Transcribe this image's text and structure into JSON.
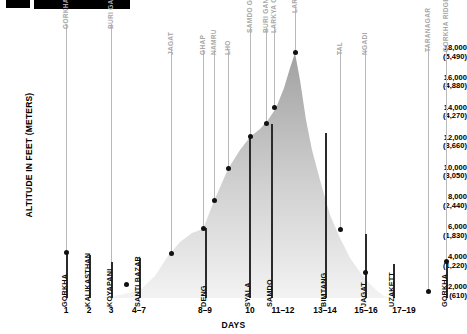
{
  "chart_data": {
    "type": "area",
    "title": "",
    "xlabel": "DAYS",
    "ylabel": "ALTITUDE IN FEET (METERS)",
    "ylim": [
      2000,
      19000
    ],
    "grid": false,
    "legend_position": "none",
    "y_ticks": [
      {
        "feet": "18,000",
        "meters": "(5,490)",
        "value": 18000
      },
      {
        "feet": "16,000",
        "meters": "(4,880)",
        "value": 16000
      },
      {
        "feet": "14,000",
        "meters": "(4,270)",
        "value": 14000
      },
      {
        "feet": "12,000",
        "meters": "(3,660)",
        "value": 12000
      },
      {
        "feet": "10,000",
        "meters": "(3,050)",
        "value": 10000
      },
      {
        "feet": "8,000",
        "meters": "(2,440)",
        "value": 8000
      },
      {
        "feet": "6,000",
        "meters": "(1,830)",
        "value": 6000
      },
      {
        "feet": "4,000",
        "meters": "(1,220)",
        "value": 4000
      },
      {
        "feet": "2,000",
        "meters": "(610)",
        "value": 2000
      }
    ],
    "day_labels": [
      {
        "label": "1",
        "x": 66
      },
      {
        "label": "2",
        "x": 89
      },
      {
        "label": "3",
        "x": 111
      },
      {
        "label": "4–7",
        "x": 139
      },
      {
        "label": "8–9",
        "x": 205
      },
      {
        "label": "10",
        "x": 250
      },
      {
        "label": "11–12",
        "x": 283
      },
      {
        "label": "13–14",
        "x": 325
      },
      {
        "label": "15–16",
        "x": 366
      },
      {
        "label": "17–19",
        "x": 404
      }
    ],
    "upper_markers": [
      {
        "name": "GORKHA DURBAR",
        "x": 66,
        "top": 22,
        "line_bottom": 252
      },
      {
        "name": "BURI GANDAKI",
        "x": 111,
        "top": 22,
        "line_bottom": 284
      },
      {
        "name": "JAGAT",
        "x": 171,
        "top": 48,
        "line_bottom": 253
      },
      {
        "name": "GHAP",
        "x": 203,
        "top": 48,
        "line_bottom": 228
      },
      {
        "name": "NAMRU",
        "x": 214,
        "top": 48,
        "line_bottom": 200
      },
      {
        "name": "LHO",
        "x": 228,
        "top": 48,
        "line_bottom": 168
      },
      {
        "name": "SAMDO GROUP",
        "x": 250,
        "top": 26,
        "line_bottom": 136
      },
      {
        "name": "BURI GANDAKI",
        "x": 266,
        "top": 26,
        "line_bottom": 123
      },
      {
        "name": "LARKYA CAMP",
        "x": 274,
        "top": 26,
        "line_bottom": 107
      },
      {
        "name": "LARKYA LA",
        "x": 295,
        "top": 6,
        "line_bottom": 52
      },
      {
        "name": "TAL",
        "x": 340,
        "top": 48,
        "line_bottom": 229
      },
      {
        "name": "NGADI",
        "x": 365,
        "top": 48,
        "line_bottom": 272
      },
      {
        "name": "TARANAGAR",
        "x": 428,
        "top": 45,
        "line_bottom": 291
      },
      {
        "name": "GORKHA RIDGE",
        "x": 446,
        "top": 45,
        "line_bottom": 261
      }
    ],
    "lower_markers": [
      {
        "name": "GORKHA",
        "x": 66,
        "top": 252,
        "bottom": 298
      },
      {
        "name": "KALIKASTHAN",
        "x": 89,
        "top": 255,
        "bottom": 298
      },
      {
        "name": "KOYAPANI",
        "x": 111,
        "top": 262,
        "bottom": 298
      },
      {
        "name": "SANTI BAZAR",
        "x": 139,
        "top": 258,
        "bottom": 298
      },
      {
        "name": "DENG",
        "x": 205,
        "top": 228,
        "bottom": 298
      },
      {
        "name": "SYALA",
        "x": 249,
        "top": 137,
        "bottom": 298
      },
      {
        "name": "SAMDO",
        "x": 271,
        "top": 124,
        "bottom": 298
      },
      {
        "name": "BIMTANG",
        "x": 325,
        "top": 133,
        "bottom": 298
      },
      {
        "name": "JAGAT",
        "x": 365,
        "top": 234,
        "bottom": 298
      },
      {
        "name": "UZAKETT",
        "x": 393,
        "top": 264,
        "bottom": 298
      },
      {
        "name": "GORKHA",
        "x": 446,
        "top": 262,
        "bottom": 298
      }
    ],
    "data_points": [
      {
        "name": "Gorkha",
        "day": "1",
        "x": 66,
        "y": 252,
        "feet": 4500
      },
      {
        "name": "Santi Bazar",
        "day": "4–7",
        "x": 126,
        "y": 284,
        "feet": 2250
      },
      {
        "name": "Jagat",
        "day": "8",
        "x": 171,
        "y": 253,
        "feet": 4450
      },
      {
        "name": "Ghap",
        "day": "8–9",
        "x": 203,
        "y": 228,
        "feet": 6200
      },
      {
        "name": "Namru",
        "day": "9",
        "x": 214,
        "y": 200,
        "feet": 8200
      },
      {
        "name": "Lho",
        "day": "10",
        "x": 228,
        "y": 168,
        "feet": 10250
      },
      {
        "name": "Samdo Group",
        "day": "10",
        "x": 250,
        "y": 136,
        "feet": 12450
      },
      {
        "name": "Buri Gandaki",
        "day": "11–12",
        "x": 266,
        "y": 123,
        "feet": 13450
      },
      {
        "name": "Larkya Camp",
        "day": "12",
        "x": 274,
        "y": 107,
        "feet": 14500
      },
      {
        "name": "Larkya La",
        "day": "13",
        "x": 295,
        "y": 52,
        "feet": 18300
      },
      {
        "name": "Tal",
        "day": "15–16",
        "x": 340,
        "y": 229,
        "feet": 6100
      },
      {
        "name": "Ngadi",
        "day": "16–17",
        "x": 365,
        "y": 272,
        "feet": 3100
      },
      {
        "name": "Taranagar",
        "day": "18",
        "x": 428,
        "y": 291,
        "feet": 2100
      },
      {
        "name": "Gorkha Ridge",
        "day": "19",
        "x": 446,
        "y": 261,
        "feet": 4050
      }
    ],
    "profile_path": "M 100,298 L 120,295 L 140,290 L 155,276 L 168,256 L 180,242 L 192,233 L 203,229 L 214,201 L 228,169 L 240,150 L 250,137 L 260,129 L 268,120 L 276,108 L 284,88 L 290,68 L 295,53 L 300,80 L 306,120 L 312,150 L 320,180 L 330,215 L 340,238 L 350,258 L 360,272 L 368,282 L 376,290 L 384,296 L 392,298 Z",
    "series_note": "Manaslu Circuit trek altitude profile, Gorkha to Gorkha"
  },
  "header": {
    "bar_left_label": "",
    "bar_right_label": ""
  }
}
